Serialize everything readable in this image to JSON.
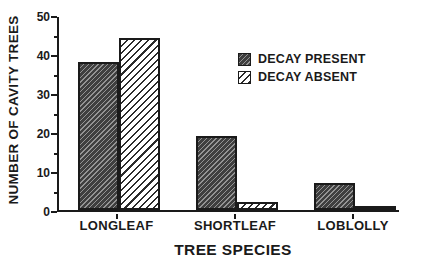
{
  "chart_data": {
    "type": "bar",
    "title": "",
    "xlabel": "TREE SPECIES",
    "ylabel": "NUMBER OF CAVITY TREES",
    "categories": [
      "LONGLEAF",
      "SHORTLEAF",
      "LOBLOLLY"
    ],
    "series": [
      {
        "name": "DECAY PRESENT",
        "pattern": "dense-dark-diagonal-hatch",
        "values": [
          38,
          19,
          7
        ]
      },
      {
        "name": "DECAY ABSENT",
        "pattern": "light-diagonal-hatch",
        "values": [
          44,
          2,
          1
        ]
      }
    ],
    "ylim": [
      0,
      50
    ],
    "y_major_ticks": [
      0,
      10,
      20,
      30,
      40,
      50
    ],
    "y_minor_tick_step": 5,
    "grid": false,
    "legend_position": "upper-right-inside"
  },
  "colors": {
    "background": "#ffffff",
    "ink": "#1a1a1a",
    "present_base": "#3f3f3f",
    "present_line": "#949494",
    "absent_base": "#ffffff",
    "absent_line": "#2b2b2b"
  }
}
